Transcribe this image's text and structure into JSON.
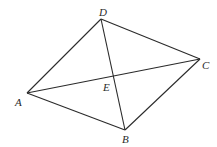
{
  "diagram": {
    "type": "geometry",
    "stroke_color": "#2a2a2a",
    "background": "#ffffff",
    "points": {
      "A": {
        "label": "A",
        "x": 27,
        "y": 93,
        "lx": 15,
        "ly": 106
      },
      "B": {
        "label": "B",
        "x": 125,
        "y": 130,
        "lx": 122,
        "ly": 143
      },
      "C": {
        "label": "C",
        "x": 200,
        "y": 59,
        "lx": 202,
        "ly": 69
      },
      "D": {
        "label": "D",
        "x": 101,
        "y": 19,
        "lx": 99,
        "ly": 16
      },
      "E": {
        "label": "E",
        "x": 114,
        "y": 76,
        "lx": 103,
        "ly": 91
      }
    },
    "segments": [
      {
        "name": "AD",
        "from": "A",
        "to": "D"
      },
      {
        "name": "DC",
        "from": "D",
        "to": "C"
      },
      {
        "name": "CB",
        "from": "C",
        "to": "B"
      },
      {
        "name": "BA",
        "from": "B",
        "to": "A"
      },
      {
        "name": "AC",
        "from": "A",
        "to": "C"
      },
      {
        "name": "DB",
        "from": "D",
        "to": "B"
      }
    ]
  }
}
